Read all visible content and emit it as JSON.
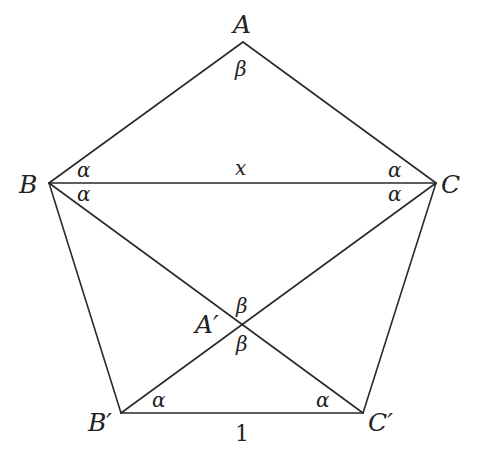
{
  "diagram": {
    "type": "geometry",
    "vertices": {
      "A": {
        "label": "A",
        "x": 243,
        "y": 42
      },
      "B": {
        "label": "B",
        "x": 49,
        "y": 183
      },
      "C": {
        "label": "C",
        "x": 436,
        "y": 183
      },
      "B2": {
        "label": "B′",
        "x": 121,
        "y": 413
      },
      "C2": {
        "label": "C′",
        "x": 363,
        "y": 413
      },
      "A2": {
        "label": "A′",
        "x": 242,
        "y": 324
      }
    },
    "segment_labels": {
      "BC": "x",
      "B2C2": "1"
    },
    "angle_labels": {
      "A_top": "β",
      "B_upper": "α",
      "B_lower": "α",
      "C_upper": "α",
      "C_lower": "α",
      "A2_upper": "β",
      "A2_lower": "β",
      "B2": "α",
      "C2": "α"
    }
  }
}
